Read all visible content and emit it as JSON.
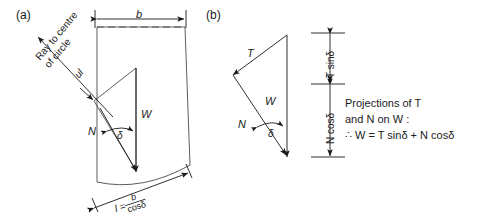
{
  "figure": {
    "panel_a": {
      "id": "(a)",
      "dim_top": "b",
      "ray_line1": "Ray to centre",
      "ray_line2": "of circle",
      "slice_label": "ul",
      "force_w": "W",
      "force_n": "N",
      "angle": "δ",
      "bottom_l": "l =",
      "bottom_num": "b",
      "bottom_den": "cosδ"
    },
    "panel_b": {
      "id": "(b)",
      "force_t": "T",
      "force_w": "W",
      "force_n": "N",
      "angle": "δ",
      "dim_upper": "T sinδ",
      "dim_lower": "N cosδ"
    },
    "note": {
      "line1": "Projections of T",
      "line2": "and N on W :",
      "line3": "∴  W = T sinδ + N cosδ"
    },
    "colors": {
      "ink": "#1a1a1a",
      "line": "#4a4a4a",
      "background": "#ffffff"
    }
  }
}
